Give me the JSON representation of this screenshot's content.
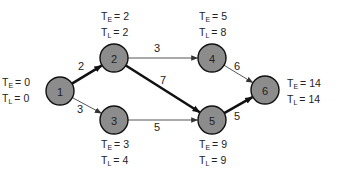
{
  "diagram": {
    "type": "critical-path-network",
    "colors": {
      "node_fill": "#8c8c8c",
      "node_stroke": "#111111",
      "edge_normal": "#555555",
      "edge_critical": "#111111",
      "text": "#222222"
    },
    "nodes": [
      {
        "id": "1",
        "label": "1",
        "cx": 60,
        "cy": 91,
        "te_label": "T",
        "te_sub": "E",
        "te_value": "= 0",
        "tl_label": "T",
        "tl_sub": "L",
        "tl_value": "= 0",
        "label_pos": "left"
      },
      {
        "id": "2",
        "label": "2",
        "cx": 114,
        "cy": 58,
        "te_label": "T",
        "te_sub": "E",
        "te_value": "= 2",
        "tl_label": "T",
        "tl_sub": "L",
        "tl_value": "= 2",
        "label_pos": "top"
      },
      {
        "id": "3",
        "label": "3",
        "cx": 114,
        "cy": 120,
        "te_label": "T",
        "te_sub": "E",
        "te_value": "= 3",
        "tl_label": "T",
        "tl_sub": "L",
        "tl_value": "= 4",
        "label_pos": "bottom"
      },
      {
        "id": "4",
        "label": "4",
        "cx": 212,
        "cy": 58,
        "te_label": "T",
        "te_sub": "E",
        "te_value": "= 5",
        "tl_label": "T",
        "tl_sub": "L",
        "tl_value": "= 8",
        "label_pos": "top"
      },
      {
        "id": "5",
        "label": "5",
        "cx": 212,
        "cy": 120,
        "te_label": "T",
        "te_sub": "E",
        "te_value": "= 9",
        "tl_label": "T",
        "tl_sub": "L",
        "tl_value": "= 9",
        "label_pos": "bottom"
      },
      {
        "id": "6",
        "label": "6",
        "cx": 265,
        "cy": 90,
        "te_label": "T",
        "te_sub": "E",
        "te_value": "= 14",
        "tl_label": "T",
        "tl_sub": "L",
        "tl_value": "= 14",
        "label_pos": "right"
      }
    ],
    "edges": [
      {
        "from": "1",
        "to": "2",
        "weight": "2",
        "critical": true,
        "lx": 81,
        "ly": 66
      },
      {
        "from": "1",
        "to": "3",
        "weight": "3",
        "critical": false,
        "lx": 80,
        "ly": 109
      },
      {
        "from": "2",
        "to": "4",
        "weight": "3",
        "critical": false,
        "lx": 157,
        "ly": 48
      },
      {
        "from": "2",
        "to": "5",
        "weight": "7",
        "critical": true,
        "lx": 163,
        "ly": 80
      },
      {
        "from": "3",
        "to": "5",
        "weight": "5",
        "critical": false,
        "lx": 157,
        "ly": 127
      },
      {
        "from": "4",
        "to": "6",
        "weight": "6",
        "critical": false,
        "lx": 237,
        "ly": 66
      },
      {
        "from": "5",
        "to": "6",
        "weight": "5",
        "critical": true,
        "lx": 237,
        "ly": 116
      }
    ]
  }
}
